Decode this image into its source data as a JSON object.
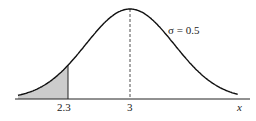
{
  "chart_data": {
    "type": "area",
    "title": "",
    "distribution": "normal",
    "mean": 3,
    "sigma": 0.5,
    "xlabel": "x",
    "ylabel": "",
    "tick_labels": [
      "2.3",
      "3"
    ],
    "annotation": "σ = 0.5",
    "shaded_region": {
      "from": "-inf",
      "to": 2.3,
      "color": "#cccccc"
    },
    "dashed_line_at": 3,
    "grid": false,
    "legend": null
  },
  "labels": {
    "tick_left": "2.3",
    "tick_mean": "3",
    "axis_x": "x",
    "sigma_annotation": "σ = 0.5"
  }
}
